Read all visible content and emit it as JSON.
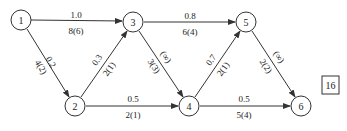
{
  "diagram": {
    "type": "network-flow-graph",
    "nodes": [
      {
        "id": "1",
        "label": "1",
        "x": 21,
        "y": 20
      },
      {
        "id": "2",
        "label": "2",
        "x": 75,
        "y": 106
      },
      {
        "id": "3",
        "label": "3",
        "x": 133,
        "y": 22
      },
      {
        "id": "4",
        "label": "4",
        "x": 189,
        "y": 106
      },
      {
        "id": "5",
        "label": "5",
        "x": 246,
        "y": 22
      },
      {
        "id": "6",
        "label": "6",
        "x": 301,
        "y": 106
      }
    ],
    "edges": [
      {
        "from": "1",
        "to": "3",
        "cost": "1.0",
        "capacity_flow": "8(6)"
      },
      {
        "from": "1",
        "to": "2",
        "cost": "0.2",
        "capacity_flow": "4(2)"
      },
      {
        "from": "2",
        "to": "3",
        "cost": "0.3",
        "capacity_flow": "2(1)"
      },
      {
        "from": "3",
        "to": "4",
        "cost": "(∞)",
        "capacity_flow": "3(3)"
      },
      {
        "from": "3",
        "to": "5",
        "cost": "0.8",
        "capacity_flow": "6(4)"
      },
      {
        "from": "2",
        "to": "4",
        "cost": "0.5",
        "capacity_flow": "2(1)"
      },
      {
        "from": "4",
        "to": "5",
        "cost": "0.7",
        "capacity_flow": "2(1)"
      },
      {
        "from": "5",
        "to": "6",
        "cost": "(∞)",
        "capacity_flow": "2(2)"
      },
      {
        "from": "4",
        "to": "6",
        "cost": "0.5",
        "capacity_flow": "5(4)"
      }
    ],
    "tag": {
      "label": "16"
    }
  }
}
